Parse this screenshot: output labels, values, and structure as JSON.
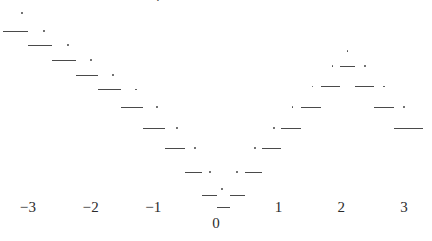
{
  "figure": {
    "width": 432,
    "height": 241,
    "background": "#ffffff",
    "ink_color": "#4a4a4a",
    "text_color": "#2b2b2b",
    "top_partial_label": "2"
  },
  "chart_data": {
    "type": "line",
    "title": "",
    "subtitle": "",
    "xlabel": "",
    "ylabel": "",
    "style": "step-function with open-dot endpoints",
    "grid": false,
    "legend": null,
    "xlim": [
      -3.4,
      3.4
    ],
    "ylim": [
      0,
      11
    ],
    "xticks": [
      -3,
      -2,
      -1,
      0,
      1,
      2,
      3
    ],
    "xticklabels": [
      "−3",
      "−2",
      "−1",
      "0",
      "1",
      "2",
      "3"
    ],
    "annotations": [],
    "steps": [
      {
        "x_start": -3.4,
        "x_end": -3.0,
        "y": 10.0
      },
      {
        "x_start": -3.0,
        "x_end": -2.62,
        "y": 9.5
      },
      {
        "x_start": -2.62,
        "x_end": -2.24,
        "y": 9.0
      },
      {
        "x_start": -2.24,
        "x_end": -1.88,
        "y": 8.5
      },
      {
        "x_start": -1.88,
        "x_end": -1.52,
        "y": 8.0
      },
      {
        "x_start": -1.52,
        "x_end": -1.16,
        "y": 7.4
      },
      {
        "x_start": -1.16,
        "x_end": -0.82,
        "y": 6.7
      },
      {
        "x_start": -0.82,
        "x_end": -0.5,
        "y": 6.0
      },
      {
        "x_start": -0.5,
        "x_end": -0.22,
        "y": 5.2
      },
      {
        "x_start": -0.22,
        "x_end": 0.02,
        "y": 4.4
      },
      {
        "x_start": 0.02,
        "x_end": 0.22,
        "y": 4.0
      },
      {
        "x_start": 0.22,
        "x_end": 0.46,
        "y": 4.4
      },
      {
        "x_start": 0.46,
        "x_end": 0.74,
        "y": 5.2
      },
      {
        "x_start": 0.74,
        "x_end": 1.04,
        "y": 6.0
      },
      {
        "x_start": 1.04,
        "x_end": 1.36,
        "y": 6.7
      },
      {
        "x_start": 1.36,
        "x_end": 1.68,
        "y": 7.4
      },
      {
        "x_start": 1.68,
        "x_end": 1.98,
        "y": 8.1
      },
      {
        "x_start": 1.98,
        "x_end": 2.22,
        "y": 8.8
      },
      {
        "x_start": 2.22,
        "x_end": 2.52,
        "y": 8.1
      },
      {
        "x_start": 2.52,
        "x_end": 2.84,
        "y": 7.4
      },
      {
        "x_start": 2.84,
        "x_end": 3.3,
        "y": 6.7
      }
    ],
    "dots": [
      {
        "x": -3.1,
        "y": 10.6
      },
      {
        "x": -2.74,
        "y": 10.0
      },
      {
        "x": -2.36,
        "y": 9.5
      },
      {
        "x": -2.0,
        "y": 9.0
      },
      {
        "x": -1.64,
        "y": 8.5
      },
      {
        "x": -1.28,
        "y": 8.0
      },
      {
        "x": -0.94,
        "y": 7.4
      },
      {
        "x": -0.62,
        "y": 6.7
      },
      {
        "x": -0.34,
        "y": 6.0
      },
      {
        "x": -0.1,
        "y": 5.2
      },
      {
        "x": 0.1,
        "y": 4.6
      },
      {
        "x": 0.34,
        "y": 5.2
      },
      {
        "x": 0.62,
        "y": 6.0
      },
      {
        "x": 0.92,
        "y": 6.7
      },
      {
        "x": 1.22,
        "y": 7.4
      },
      {
        "x": 1.54,
        "y": 8.1
      },
      {
        "x": 1.86,
        "y": 8.8
      },
      {
        "x": 2.1,
        "y": 9.3
      },
      {
        "x": 2.38,
        "y": 8.8
      },
      {
        "x": 2.68,
        "y": 8.1
      },
      {
        "x": 3.0,
        "y": 7.4
      }
    ]
  }
}
